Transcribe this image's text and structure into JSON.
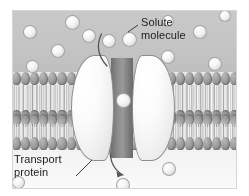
{
  "figure": {
    "regions": {
      "extracellular_label": "",
      "intracellular_label": ""
    }
  },
  "labels": [
    {
      "id": "solute",
      "text": "Solute\nmolecule",
      "name": "solute-molecule-label"
    },
    {
      "id": "protein",
      "text": "Transport\nprotein",
      "name": "transport-protein-label"
    }
  ],
  "structures": {
    "membrane": {
      "name": "phospholipid-bilayer",
      "head_count_per_row": 25,
      "rows": 4,
      "head_color": "#9e9e9e",
      "tail_color": "#c8c8c8"
    },
    "transport_protein": {
      "name": "transport-protein",
      "lobes": 2,
      "lobe_color": "#f7f7f7",
      "channel_color": "#8a8a8a"
    }
  },
  "colors": {
    "extracellular_bg": "#c4c4c4",
    "intracellular_bg": "#f7f7f7",
    "solute_fill": "#f2f2f2",
    "outline": "#8d8d8d",
    "text": "#1c1c1c",
    "arrow": "#555555"
  },
  "solutes": {
    "in_channel": [
      {
        "x": 104,
        "y": 83,
        "d": 13
      }
    ],
    "extracellular": [
      {
        "x": 11,
        "y": 15,
        "d": 12
      },
      {
        "x": 53,
        "y": 5,
        "d": 13
      },
      {
        "x": 70,
        "y": 19,
        "d": 12
      },
      {
        "x": 39,
        "y": 34,
        "d": 12
      },
      {
        "x": 14,
        "y": 50,
        "d": 11
      },
      {
        "x": 90,
        "y": 24,
        "d": 12
      },
      {
        "x": 110,
        "y": 22,
        "d": 13
      },
      {
        "x": 149,
        "y": 40,
        "d": 12
      },
      {
        "x": 181,
        "y": 15,
        "d": 12
      },
      {
        "x": 196,
        "y": 47,
        "d": 12
      },
      {
        "x": 150,
        "y": 5,
        "d": 10
      },
      {
        "x": 207,
        "y": 0,
        "d": 10
      }
    ],
    "intracellular": [
      {
        "x": 104,
        "y": 168,
        "d": 12
      },
      {
        "x": 150,
        "y": 152,
        "d": 12
      },
      {
        "x": 0,
        "y": 166,
        "d": 11
      }
    ]
  },
  "arrows": {
    "influx": {
      "name": "solute-influx-arrow",
      "from": "extracellular solute",
      "to": "channel"
    },
    "efflux": {
      "name": "solute-efflux-arrow",
      "from": "channel",
      "to": "intracellular solute"
    }
  }
}
